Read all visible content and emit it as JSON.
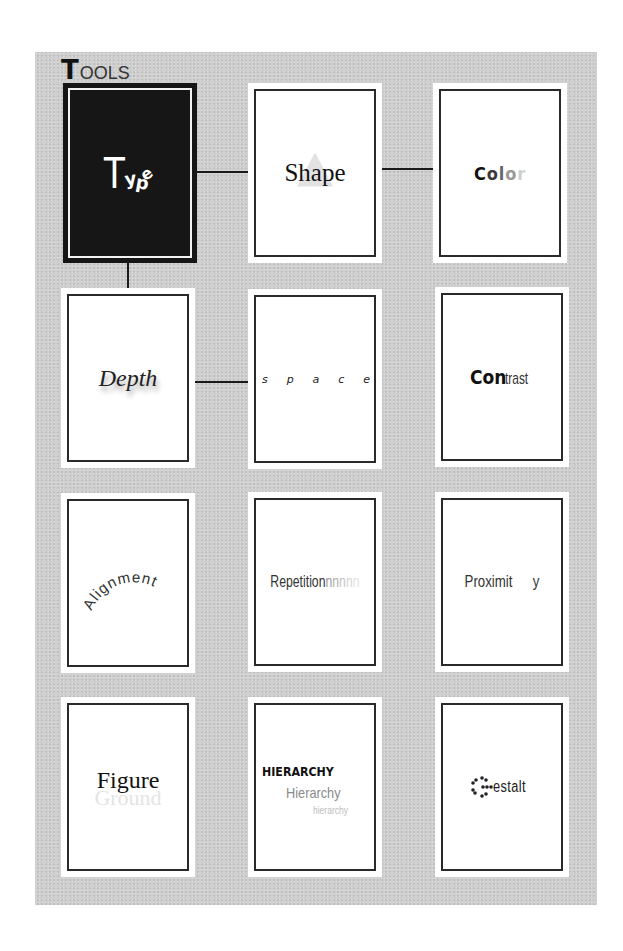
{
  "title": {
    "initial": "T",
    "rest": "OOLS"
  },
  "cards": {
    "type": {
      "T": "T",
      "y": "y",
      "p": "p",
      "e": "e"
    },
    "shape": {
      "label": "Shape"
    },
    "color": {
      "letters": [
        "C",
        "o",
        "l",
        "o",
        "r"
      ]
    },
    "depth": {
      "label": "Depth"
    },
    "space": {
      "letters": [
        "s",
        "p",
        "a",
        "c",
        "e"
      ]
    },
    "contrast": {
      "bold": "Con",
      "light": "trast"
    },
    "alignment": {
      "label": "Alignment"
    },
    "repetition": {
      "label": "Repetition",
      "echo": [
        "n",
        "n",
        "n",
        "n",
        "n"
      ]
    },
    "proximity": {
      "left": "Proximit",
      "right": "y"
    },
    "figure_ground": {
      "figure": "Figure",
      "ground": "Ground"
    },
    "hierarchy": {
      "level1": "HIERARCHY",
      "level2": "Hierarchy",
      "level3": "hierarchy"
    },
    "gestalt": {
      "word": "estalt",
      "dotted_letter": "G"
    }
  },
  "colors": {
    "panel": "#cfcfcf",
    "card_border": "#2a2a2a",
    "active_card": "#161616",
    "connector": "#1a1a1a"
  }
}
